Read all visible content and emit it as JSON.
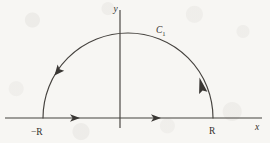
{
  "figure": {
    "background_color": "#f7f6f3",
    "ink_color": "#45423e"
  },
  "axes": {
    "x_axis": {
      "label": "x",
      "name": "x-axis",
      "y_position": 118,
      "x_start": 5,
      "x_end": 262
    },
    "y_axis": {
      "label": "y",
      "name": "y-axis",
      "x_position": 120,
      "y_start": 10,
      "y_end": 128
    }
  },
  "contour": {
    "label": "C",
    "label_subscript": "1",
    "shape": "semicircle",
    "center_x": 128,
    "center_y": 118,
    "radius": 85,
    "orientation": "counterclockwise"
  },
  "points": [
    {
      "label": "−R",
      "name": "point-minus-R",
      "x": 43,
      "y": 118
    },
    {
      "label": "R",
      "name": "point-R",
      "x": 213,
      "y": 118
    }
  ],
  "direction_arrows": [
    {
      "name": "x-axis-arrow-left",
      "x": 77,
      "y": 118,
      "direction": "right"
    },
    {
      "name": "x-axis-arrow-right",
      "x": 158,
      "y": 118,
      "direction": "right"
    },
    {
      "name": "arc-arrow-left",
      "x": 58,
      "y": 68,
      "direction": "down-left"
    },
    {
      "name": "arc-arrow-right",
      "x": 203,
      "y": 85,
      "direction": "up-left"
    }
  ]
}
